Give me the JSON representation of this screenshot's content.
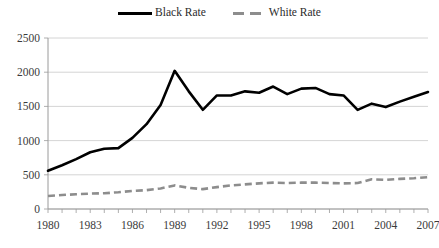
{
  "legend": {
    "position": "top-center",
    "entries": [
      {
        "label": "Black Rate",
        "style": "solid",
        "color": "#000000",
        "icon": "solid-line-swatch"
      },
      {
        "label": "White Rate",
        "style": "dashed",
        "color": "#8d8d8d",
        "icon": "dashed-line-swatch"
      }
    ]
  },
  "chart_data": {
    "type": "line",
    "title": "",
    "subtitle": "",
    "xlabel": "",
    "ylabel": "",
    "xlim": [
      1980,
      2007
    ],
    "ylim": [
      0,
      2500
    ],
    "grid": true,
    "y_ticks": [
      0,
      500,
      1000,
      1500,
      2000,
      2500
    ],
    "y_tick_labels": [
      "0",
      "500",
      "1000",
      "1500",
      "2000",
      "2500"
    ],
    "x": [
      1980,
      1981,
      1982,
      1983,
      1984,
      1985,
      1986,
      1987,
      1988,
      1989,
      1990,
      1991,
      1992,
      1993,
      1994,
      1995,
      1996,
      1997,
      1998,
      1999,
      2000,
      2001,
      2002,
      2003,
      2004,
      2005,
      2006,
      2007
    ],
    "x_tick_labels": [
      "1980",
      "1983",
      "1986",
      "1989",
      "1992",
      "1995",
      "1998",
      "2001",
      "2004",
      "2007"
    ],
    "x_labeled_years": [
      1980,
      1983,
      1986,
      1989,
      1992,
      1995,
      1998,
      2001,
      2004,
      2007
    ],
    "series": [
      {
        "name": "Black Rate",
        "color": "#000000",
        "style": "solid",
        "values": [
          560,
          640,
          730,
          830,
          880,
          890,
          1040,
          1240,
          1520,
          2020,
          1720,
          1450,
          1660,
          1660,
          1720,
          1700,
          1790,
          1680,
          1760,
          1770,
          1680,
          1660,
          1450,
          1540,
          1490,
          1570,
          1640,
          1710
        ]
      },
      {
        "name": "White Rate",
        "color": "#8d8d8d",
        "style": "dashed",
        "values": [
          190,
          205,
          215,
          225,
          230,
          245,
          265,
          275,
          300,
          345,
          310,
          290,
          320,
          345,
          360,
          375,
          385,
          380,
          385,
          385,
          380,
          375,
          380,
          435,
          425,
          440,
          450,
          465
        ]
      }
    ]
  }
}
